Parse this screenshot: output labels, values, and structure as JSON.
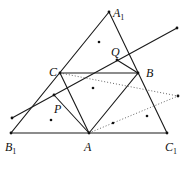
{
  "diagram": {
    "title": "",
    "labels": {
      "A1": {
        "main": "A",
        "sub": "1"
      },
      "Q": {
        "main": "Q",
        "sub": ""
      },
      "C": {
        "main": "C",
        "sub": ""
      },
      "B": {
        "main": "B",
        "sub": ""
      },
      "P": {
        "main": "P",
        "sub": ""
      },
      "B1": {
        "main": "B",
        "sub": "1"
      },
      "A": {
        "main": "A",
        "sub": ""
      },
      "C1": {
        "main": "C",
        "sub": "1"
      }
    },
    "points": {
      "A1": [
        109,
        12
      ],
      "B1": [
        11,
        133
      ],
      "C1": [
        167,
        133
      ],
      "A": [
        89,
        133
      ],
      "B": [
        138,
        73
      ],
      "C": [
        60,
        73
      ],
      "P": [
        54,
        95
      ],
      "Q": [
        117,
        60
      ],
      "line_left_end": [
        12,
        118
      ],
      "line_right_end": [
        177,
        28
      ],
      "dotted_right_end": [
        178,
        96
      ]
    },
    "extra_dots": [
      [
        99,
        42
      ],
      [
        93,
        88
      ],
      [
        51,
        120
      ],
      [
        113,
        123
      ],
      [
        147,
        116
      ]
    ]
  }
}
